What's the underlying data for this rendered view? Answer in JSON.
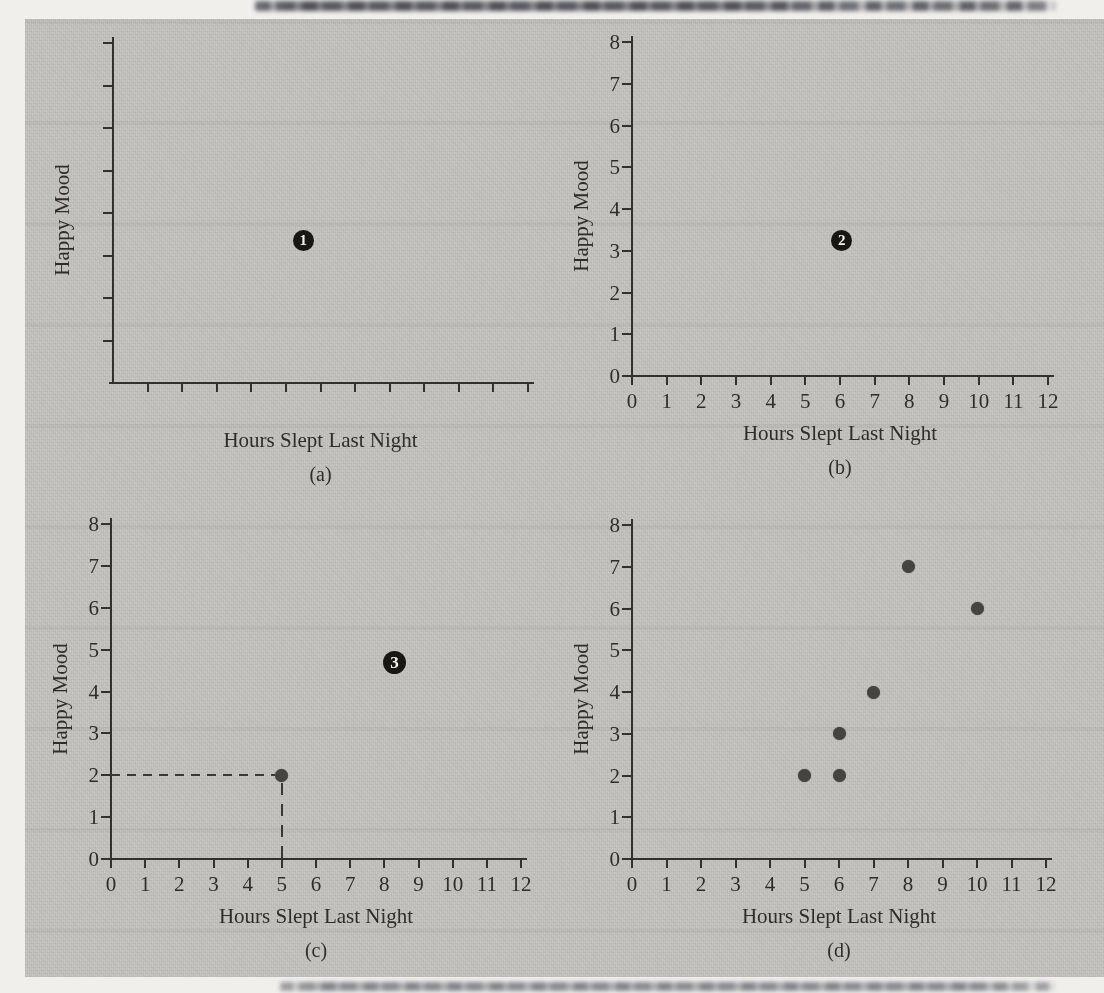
{
  "figure": {
    "page_background_hex": "#f1efec",
    "panel_background_hex": "#c6c4c0",
    "ink_hex": "#2f2d2a",
    "point_hex": "#46443f",
    "badge_background_hex": "#191714",
    "badge_text_hex": "#f3f2ee"
  },
  "chart_data": [
    {
      "type": "scatter",
      "caption": "(a)",
      "xlabel": "Hours Slept Last Night",
      "ylabel": "Happy Mood",
      "xlim": [
        0,
        12
      ],
      "ylim": [
        0,
        8
      ],
      "x_ticks": [
        1,
        2,
        3,
        4,
        5,
        6,
        7,
        8,
        9,
        10,
        11,
        12
      ],
      "y_ticks": [
        1,
        2,
        3,
        4,
        5,
        6,
        7,
        8
      ],
      "x_tick_labels_visible": false,
      "y_tick_labels_visible": false,
      "grid": false,
      "points": [],
      "step_badge": {
        "label": "1",
        "x": 5.5,
        "y": 3.35
      }
    },
    {
      "type": "scatter",
      "caption": "(b)",
      "xlabel": "Hours Slept Last Night",
      "ylabel": "Happy Mood",
      "xlim": [
        0,
        12
      ],
      "ylim": [
        0,
        8
      ],
      "x_ticks": [
        0,
        1,
        2,
        3,
        4,
        5,
        6,
        7,
        8,
        9,
        10,
        11,
        12
      ],
      "y_ticks": [
        0,
        1,
        2,
        3,
        4,
        5,
        6,
        7,
        8
      ],
      "x_tick_labels_visible": true,
      "y_tick_labels_visible": true,
      "grid": false,
      "points": [],
      "step_badge": {
        "label": "2",
        "x": 6.05,
        "y": 3.25
      }
    },
    {
      "type": "scatter",
      "caption": "(c)",
      "xlabel": "Hours Slept Last Night",
      "ylabel": "Happy Mood",
      "xlim": [
        0,
        12
      ],
      "ylim": [
        0,
        8
      ],
      "x_ticks": [
        0,
        1,
        2,
        3,
        4,
        5,
        6,
        7,
        8,
        9,
        10,
        11,
        12
      ],
      "y_ticks": [
        0,
        1,
        2,
        3,
        4,
        5,
        6,
        7,
        8
      ],
      "x_tick_labels_visible": true,
      "y_tick_labels_visible": true,
      "grid": false,
      "points": [
        {
          "x": 5,
          "y": 2
        }
      ],
      "dashed_guides": {
        "x": 5,
        "y": 2
      },
      "step_badge": {
        "label": "3",
        "x": 8.3,
        "y": 4.7
      }
    },
    {
      "type": "scatter",
      "caption": "(d)",
      "xlabel": "Hours Slept Last Night",
      "ylabel": "Happy Mood",
      "xlim": [
        0,
        12
      ],
      "ylim": [
        0,
        8
      ],
      "x_ticks": [
        0,
        1,
        2,
        3,
        4,
        5,
        6,
        7,
        8,
        9,
        10,
        11,
        12
      ],
      "y_ticks": [
        0,
        1,
        2,
        3,
        4,
        5,
        6,
        7,
        8
      ],
      "x_tick_labels_visible": true,
      "y_tick_labels_visible": true,
      "grid": false,
      "points": [
        {
          "x": 5,
          "y": 2
        },
        {
          "x": 6,
          "y": 2
        },
        {
          "x": 6,
          "y": 3
        },
        {
          "x": 7,
          "y": 4
        },
        {
          "x": 8,
          "y": 7
        },
        {
          "x": 10,
          "y": 6
        }
      ]
    }
  ]
}
